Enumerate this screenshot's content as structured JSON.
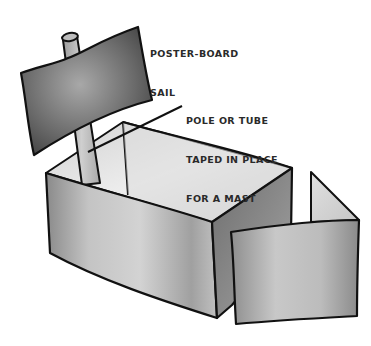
{
  "illustration": {
    "subject": "cardboard box boat with poster-board sail",
    "colors": {
      "outline": "#111111",
      "sail_dark": "#4a4a4a",
      "sail_light": "#9a9a9a",
      "box_light": "#e6e6e6",
      "box_mid": "#bdbdbd",
      "box_dark": "#7d7d7d",
      "background": "#ffffff"
    }
  },
  "labels": {
    "sail": {
      "line1": "POSTER-BOARD",
      "line2": "SAIL"
    },
    "mast": {
      "line1": "POLE OR TUBE",
      "line2": "TAPED IN PLACE",
      "line3": "FOR A MAST"
    }
  }
}
